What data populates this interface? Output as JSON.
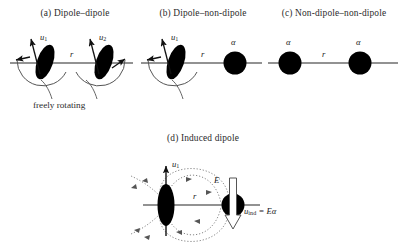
{
  "figure": {
    "background_color": "#ffffff",
    "ink_color": "#1a1a1a",
    "line_color": "#555555",
    "dipole_color": "#000000"
  },
  "panels": [
    {
      "id": "a",
      "title": "(a) Dipole–dipole",
      "type": "dipole-dipole",
      "separation_label": "r",
      "dipoles": [
        {
          "label_u": "u",
          "label_sub": "1"
        },
        {
          "label_u": "u",
          "label_sub": "2"
        }
      ],
      "annotation": "freely rotating"
    },
    {
      "id": "b",
      "title": "(b) Dipole–non-dipole",
      "type": "dipole-nondipole",
      "separation_label": "r",
      "dipoles": [
        {
          "label_u": "u",
          "label_sub": "1"
        }
      ],
      "polarizabilities": [
        "α"
      ]
    },
    {
      "id": "c",
      "title": "(c) Non-dipole–non-dipole",
      "type": "nondipole-nondipole",
      "separation_label": "r",
      "polarizabilities": [
        "α",
        "α"
      ]
    },
    {
      "id": "d",
      "title": "(d) Induced dipole",
      "type": "induced-dipole",
      "separation_label": "r",
      "permanent_dipole": {
        "label_u": "u",
        "label_sub": "1"
      },
      "field_label": "E",
      "induced_label_u": "u",
      "induced_label_sub": "ind",
      "induced_equation": "= Eα"
    }
  ]
}
